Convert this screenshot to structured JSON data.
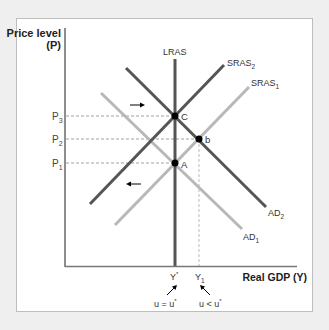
{
  "axes": {
    "y_label_line1": "Price level",
    "y_label_line2": "(P)",
    "x_label": "Real GDP (Y)"
  },
  "price_levels": [
    {
      "base": "P",
      "sub": "3",
      "y": 116
    },
    {
      "base": "P",
      "sub": "2",
      "y": 139
    },
    {
      "base": "P",
      "sub": "1",
      "y": 163
    }
  ],
  "curves": {
    "lras": {
      "label": "LRAS"
    },
    "sras2": {
      "base": "SRAS",
      "sub": "2"
    },
    "sras1": {
      "base": "SRAS",
      "sub": "1"
    },
    "ad2": {
      "base": "AD",
      "sub": "2"
    },
    "ad1": {
      "base": "AD",
      "sub": "1"
    }
  },
  "points": {
    "c": "C",
    "b": "b",
    "a": "A"
  },
  "x_ticks": {
    "ystar": {
      "base": "Y",
      "sup": "*"
    },
    "y1": {
      "base": "Y",
      "sub": "1"
    }
  },
  "annotations": {
    "u_equal": {
      "text": "u = u",
      "sup": "*"
    },
    "u_less": {
      "text": "u < u",
      "sup": "*"
    }
  },
  "colors": {
    "dark_line": "#555555",
    "light_line": "#b8b8b8",
    "axis": "#444444",
    "background": "#efefef"
  }
}
